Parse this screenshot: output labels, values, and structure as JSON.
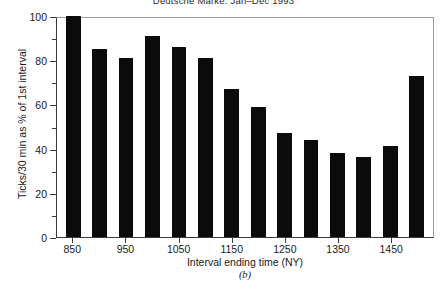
{
  "chart_data": {
    "type": "bar",
    "title": "Deutsche Marke, Jan–Dec 1993",
    "xlabel": "Interval ending time (NY)",
    "ylabel": "Ticks/30 min as % of 1st interval",
    "panel_label": "(b)",
    "grid": false,
    "legend": null,
    "bar_color": "#0b0b0b",
    "axis_color": "#3a3a3a",
    "ylim": [
      0,
      100
    ],
    "ytick_values": [
      0,
      20,
      40,
      60,
      80,
      100
    ],
    "ytick_labels": [
      "0",
      "20",
      "40",
      "60",
      "80",
      "100"
    ],
    "yminor_values": [
      10,
      30,
      50,
      70,
      90
    ],
    "categories": [
      "850",
      "900",
      "950",
      "1000",
      "1050",
      "1100",
      "1150",
      "1200",
      "1250",
      "1300",
      "1350",
      "1400",
      "1450",
      "1500"
    ],
    "xtick_labels": [
      "850",
      "950",
      "1050",
      "1150",
      "1250",
      "1350",
      "1450"
    ],
    "xtick_categories": [
      "850",
      "950",
      "1050",
      "1150",
      "1250",
      "1350",
      "1450"
    ],
    "values": [
      100,
      85,
      81,
      91,
      86,
      81,
      67,
      59,
      47,
      44,
      38,
      36,
      41,
      73
    ]
  }
}
